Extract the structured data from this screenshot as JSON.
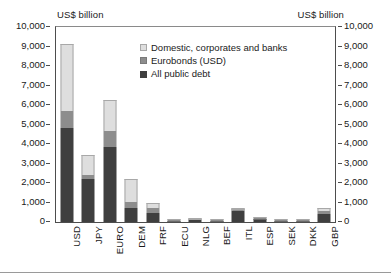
{
  "axis_titles": {
    "left": "US$ billion",
    "right": "US$ billion"
  },
  "legend": {
    "items": [
      {
        "label": "Domestic, corporates and banks",
        "color": "#dedede",
        "key": "domestic"
      },
      {
        "label": "Eurobonds (USD)",
        "color": "#8d8d8d",
        "key": "eurobonds"
      },
      {
        "label": "All public debt",
        "color": "#3f3f3f",
        "key": "public"
      }
    ]
  },
  "chart_data": {
    "type": "bar",
    "title": "",
    "subtitle": "",
    "xlabel": "",
    "ylabel": "US$ billion",
    "y2label": "US$ billion",
    "stacked": true,
    "grid": false,
    "legend_position": "inside-top-right",
    "ylim": [
      0,
      10000
    ],
    "y2lim": [
      0,
      10000
    ],
    "ytick_labels": [
      "10,000",
      "9,000",
      "8,000",
      "7,000",
      "6,000",
      "5,000",
      "4,000",
      "3,000",
      "2,000",
      "1,000",
      "0"
    ],
    "yticks": [
      10000,
      9000,
      8000,
      7000,
      6000,
      5000,
      4000,
      3000,
      2000,
      1000,
      0
    ],
    "y2tick_labels": [
      "10,000",
      "9,000",
      "8,000",
      "7,000",
      "6,000",
      "5,000",
      "4,000",
      "3,000",
      "2,000",
      "1,000",
      "0"
    ],
    "categories": [
      "USD",
      "JPY",
      "EURO",
      "DEM",
      "FRF",
      "ECU",
      "NLG",
      "BEF",
      "ITL",
      "ESP",
      "SEK",
      "DKK",
      "GBP"
    ],
    "series": [
      {
        "name": "All public debt",
        "color": "#3f3f3f",
        "values": [
          4800,
          2200,
          3870,
          740,
          450,
          40,
          110,
          70,
          560,
          175,
          75,
          60,
          400
        ]
      },
      {
        "name": "Eurobonds (USD)",
        "color": "#8d8d8d",
        "values": [
          880,
          200,
          800,
          270,
          250,
          20,
          50,
          30,
          110,
          30,
          25,
          20,
          180
        ]
      },
      {
        "name": "Domestic, corporates and banks",
        "color": "#dedede",
        "values": [
          3470,
          1030,
          1570,
          1190,
          250,
          20,
          30,
          20,
          20,
          20,
          20,
          20,
          120
        ]
      }
    ],
    "totals": [
      9150,
      3430,
      6240,
      2200,
      950,
      80,
      190,
      120,
      690,
      225,
      120,
      100,
      700
    ]
  }
}
